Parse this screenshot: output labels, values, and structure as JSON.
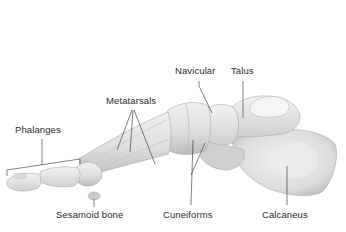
{
  "figure": {
    "labels": {
      "phalanges": "Phalanges",
      "metatarsals": "Metatarsals",
      "navicular": "Navicular",
      "talus": "Talus",
      "sesamoid": "Sesamoid bone",
      "cuneiforms": "Cuneiforms",
      "calcaneus": "Calcaneus"
    }
  },
  "colors": {
    "background": "#ffffff",
    "bone_light": "#ececec",
    "bone_mid": "#d6d6d6",
    "bone_shadow": "#b8b8b8",
    "leader_line": "#2b2b2b",
    "label_text": "#2b2b2b"
  }
}
